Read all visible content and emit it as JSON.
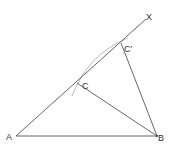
{
  "diagram": {
    "stroke_color": "#555555",
    "arc_color": "#999999",
    "points": {
      "A": {
        "label": "A",
        "x": 16,
        "y": 136
      },
      "B": {
        "label": "B",
        "x": 157,
        "y": 136
      },
      "C": {
        "label": "C",
        "x": 77,
        "y": 83
      },
      "Cprime": {
        "label": "C′",
        "x": 121,
        "y": 43
      },
      "X": {
        "label": "X",
        "x": 146,
        "y": 19
      }
    },
    "segments": [
      {
        "from": "A",
        "to": "B"
      },
      {
        "from": "A",
        "to": "X"
      },
      {
        "from": "C",
        "to": "B"
      },
      {
        "from": "Cprime",
        "to": "B"
      }
    ]
  }
}
